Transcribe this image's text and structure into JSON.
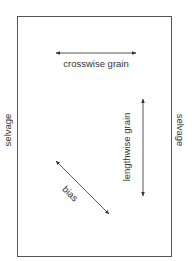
{
  "diagram": {
    "colors": {
      "line": "#555555",
      "text": "#333333",
      "background": "#ffffff"
    },
    "fabric": {
      "x": 17,
      "y": 16,
      "width": 154,
      "height": 240
    },
    "labels": {
      "selvage_left": "selvage",
      "selvage_right": "selvage",
      "crosswise": "crosswise grain",
      "lengthwise": "lengthwise grain",
      "bias": "bias"
    },
    "arrows": [
      {
        "name": "crosswise",
        "x1": 56,
        "y1": 53,
        "x2": 136,
        "y2": 53
      },
      {
        "name": "lengthwise",
        "x1": 143,
        "y1": 99,
        "x2": 143,
        "y2": 196
      },
      {
        "name": "bias",
        "x1": 56,
        "y1": 161,
        "x2": 109,
        "y2": 214
      }
    ]
  }
}
